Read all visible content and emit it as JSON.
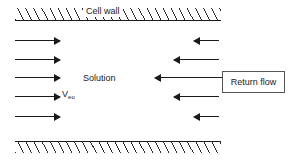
{
  "figure": {
    "type": "schematic-diagram",
    "background_color": "#ffffff",
    "line_color": "#1a1a1a"
  },
  "walls": {
    "label": "Cell wall",
    "hatch_color": "#2b2b2b",
    "top": {
      "name": "top-cell-wall"
    },
    "bottom": {
      "name": "bottom-cell-wall"
    }
  },
  "labels": {
    "solution": "Solution",
    "veo_symbol": "V",
    "veo_subscript": "eo"
  },
  "return_flow": {
    "label": "Return flow",
    "border_color": "#555555"
  },
  "arrows": {
    "electroosmotic": [
      {
        "direction": "right",
        "x": 15,
        "y": 40,
        "length": 45
      },
      {
        "direction": "right",
        "x": 15,
        "y": 59,
        "length": 45
      },
      {
        "direction": "right",
        "x": 15,
        "y": 77,
        "length": 45
      },
      {
        "direction": "right",
        "x": 15,
        "y": 96,
        "length": 45
      },
      {
        "direction": "right",
        "x": 15,
        "y": 116,
        "length": 45
      }
    ],
    "return": [
      {
        "direction": "left",
        "x": 194,
        "y": 40,
        "length": 25
      },
      {
        "direction": "left",
        "x": 174,
        "y": 59,
        "length": 45
      },
      {
        "direction": "left",
        "x": 155,
        "y": 77,
        "length": 67
      },
      {
        "direction": "left",
        "x": 174,
        "y": 96,
        "length": 45
      },
      {
        "direction": "left",
        "x": 194,
        "y": 116,
        "length": 25
      }
    ]
  }
}
